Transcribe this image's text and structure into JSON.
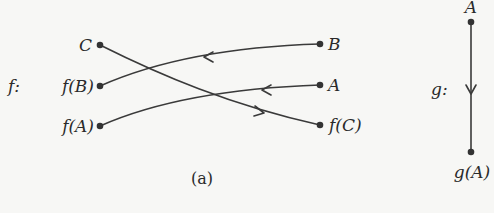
{
  "diagram": {
    "f_label": "f:",
    "g_label": "g:",
    "caption": "(a)",
    "f_nodes_left": [
      {
        "id": "C",
        "label": "C"
      },
      {
        "id": "fB",
        "label": "f(B)"
      },
      {
        "id": "fA",
        "label": "f(A)"
      }
    ],
    "f_nodes_right": [
      {
        "id": "B",
        "label": "B"
      },
      {
        "id": "A",
        "label": "A"
      },
      {
        "id": "fC",
        "label": "f(C)"
      }
    ],
    "f_edges": [
      {
        "from": "B",
        "to": "f(B)"
      },
      {
        "from": "A",
        "to": "f(A)"
      },
      {
        "from": "C",
        "to": "f(C)"
      }
    ],
    "g_nodes": [
      {
        "id": "gA_top",
        "label": "A"
      },
      {
        "id": "gA_bottom",
        "label": "g(A)"
      }
    ],
    "g_edges": [
      {
        "from": "A",
        "to": "g(A)"
      }
    ],
    "colors": {
      "ink": "#333333",
      "background": "#f7f7f5"
    }
  }
}
